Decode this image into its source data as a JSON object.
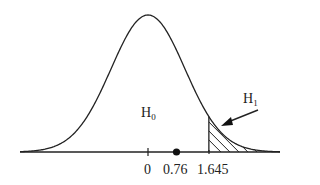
{
  "diagram": {
    "type": "normal-distribution-hypothesis-test",
    "curve_color": "#222222",
    "hatch_color": "#222222",
    "labels": {
      "null_hypothesis": {
        "main": "H",
        "sub": "0"
      },
      "alt_hypothesis": {
        "main": "H",
        "sub": "1"
      }
    },
    "axis_ticks": [
      {
        "value": 0,
        "label": "0"
      },
      {
        "value": 1.645,
        "label": "1.645"
      }
    ],
    "observed_point": {
      "value": 0.76,
      "label": "0.76"
    },
    "critical_value": 1.645,
    "rejection_region": "z > 1.645 (shaded)"
  }
}
